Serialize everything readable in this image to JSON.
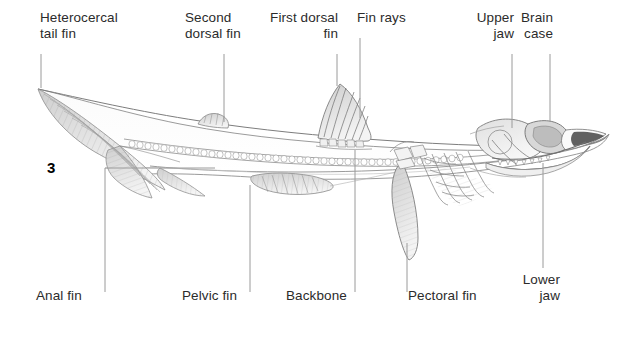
{
  "figure": {
    "number": "3",
    "background_color": "#ffffff",
    "text_color": "#2b2b2b",
    "line_color": "#8a8a8a",
    "art_color": "#6f6f6f"
  },
  "labels": {
    "top": [
      {
        "id": "heterocercal-tail-fin",
        "text": "Heterocercal\ntail fin",
        "align": "left",
        "x": 40,
        "y": 10,
        "leader_x": 41,
        "leader_y1": 54,
        "leader_y2": 88
      },
      {
        "id": "second-dorsal-fin",
        "text": "Second\ndorsal fin",
        "align": "left",
        "x": 185,
        "y": 10,
        "leader_x": 224,
        "leader_y1": 54,
        "leader_y2": 122
      },
      {
        "id": "first-dorsal-fin",
        "text": "First dorsal\nfin",
        "align": "right",
        "x": 246,
        "y": 10,
        "leader_x": 337,
        "leader_y1": 54,
        "leader_y2": 86
      },
      {
        "id": "fin-rays",
        "text": "Fin rays",
        "align": "left",
        "x": 357,
        "y": 10,
        "leader_x": 360,
        "leader_y1": 38,
        "leader_y2": 118
      },
      {
        "id": "upper-jaw",
        "text": "Upper\njaw",
        "align": "right",
        "x": 460,
        "y": 10,
        "leader_x": 512,
        "leader_y1": 54,
        "leader_y2": 128
      },
      {
        "id": "brain-case",
        "text": "Brain\ncase",
        "align": "right",
        "x": 524,
        "y": 10,
        "leader_x": 550,
        "leader_y1": 54,
        "leader_y2": 122
      }
    ],
    "bottom": [
      {
        "id": "anal-fin",
        "text": "Anal fin",
        "align": "left",
        "x": 36,
        "y": 288,
        "leader_x": 105,
        "leader_y1": 168,
        "leader_y2": 292,
        "elbow_to_x": 215
      },
      {
        "id": "pelvic-fin",
        "text": "Pelvic fin",
        "align": "left",
        "x": 182,
        "y": 288,
        "leader_x": 250,
        "leader_y1": 185,
        "leader_y2": 292
      },
      {
        "id": "backbone",
        "text": "Backbone",
        "align": "left",
        "x": 286,
        "y": 288,
        "leader_x": 355,
        "leader_y1": 150,
        "leader_y2": 292
      },
      {
        "id": "pectoral-fin",
        "text": "Pectoral fin",
        "align": "left",
        "x": 408,
        "y": 288,
        "leader_x": 407,
        "leader_y1": 243,
        "leader_y2": 292
      },
      {
        "id": "lower-jaw",
        "text": "Lower\njaw",
        "align": "right",
        "x": 530,
        "y": 272,
        "leader_x": 543,
        "leader_y1": 163,
        "leader_y2": 268
      }
    ]
  }
}
